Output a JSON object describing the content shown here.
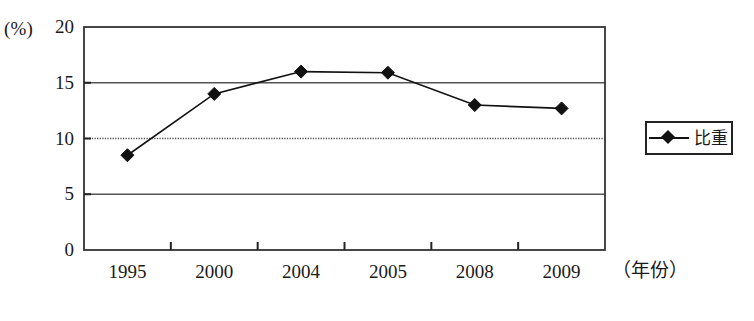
{
  "chart_data": {
    "type": "line",
    "title": "",
    "subtitle": "",
    "xlabel": "（年份）",
    "ylabel": "(%)",
    "categories": [
      "1995",
      "2000",
      "2004",
      "2005",
      "2008",
      "2009"
    ],
    "series": [
      {
        "name": "比重",
        "values": [
          8.5,
          14.0,
          16.0,
          15.9,
          13.0,
          12.7
        ],
        "marker": "diamond",
        "color": "#111111"
      }
    ],
    "ylim": [
      0,
      20
    ],
    "yticks": [
      0,
      5,
      10,
      15,
      20
    ],
    "ytick_labels": [
      "0",
      "5",
      "10",
      "15",
      "20"
    ],
    "grid": true,
    "grid_axis": "y",
    "legend_position": "right",
    "legend_entries": [
      "比重"
    ],
    "annotations": []
  },
  "axes": {
    "y_unit_label": "(%)",
    "x_axis_title": "（年份）"
  },
  "legend": {
    "label": "比重"
  },
  "colors": {
    "line": "#111111",
    "marker": "#111111",
    "frame": "#333333",
    "gridline": "#555555",
    "gridline_dotted": "#555555",
    "background": "#ffffff"
  }
}
